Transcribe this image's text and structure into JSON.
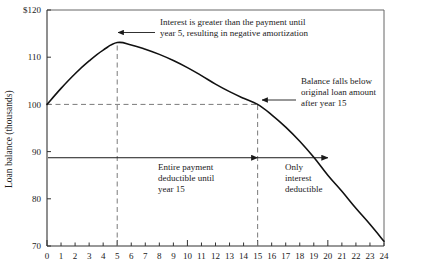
{
  "chart_data": {
    "type": "line",
    "title": "",
    "subtitle": "",
    "xlabel": "",
    "ylabel": "Loan balance (thousands)",
    "xlim": [
      0,
      24
    ],
    "ylim": [
      70,
      120
    ],
    "grid": false,
    "legend": "none",
    "x_ticks": [
      "0",
      "1",
      "2",
      "3",
      "4",
      "5",
      "6",
      "7",
      "8",
      "9",
      "10",
      "11",
      "12",
      "13",
      "14",
      "15",
      "16",
      "17",
      "18",
      "19",
      "20",
      "21",
      "22",
      "23",
      "24"
    ],
    "y_ticks": [
      "70",
      "80",
      "90",
      "100",
      "110",
      "$120"
    ],
    "y_tick_values": [
      70,
      80,
      90,
      100,
      110,
      120
    ],
    "series": [
      {
        "name": "Loan balance",
        "x": [
          0,
          1,
          2,
          3,
          4,
          5,
          6,
          7,
          8,
          9,
          10,
          11,
          12,
          13,
          14,
          15,
          16,
          17,
          18,
          19,
          20,
          21,
          22,
          23,
          24
        ],
        "values": [
          100.0,
          103.4,
          106.5,
          109.2,
          111.5,
          113.1,
          112.6,
          111.7,
          110.6,
          109.3,
          107.8,
          106.1,
          104.3,
          102.7,
          101.3,
          100.0,
          97.8,
          95.2,
          92.2,
          88.8,
          85.0,
          81.6,
          78.0,
          74.6,
          71.0
        ]
      }
    ],
    "reference_lines": [
      {
        "name": "original-loan-amount",
        "orientation": "horizontal",
        "value": 100,
        "style": "dashed",
        "from_x": 0,
        "to_x": 15
      },
      {
        "name": "year-5-marker",
        "orientation": "vertical",
        "value": 5,
        "style": "dashed",
        "from_y": 70,
        "to_y": 113.1
      },
      {
        "name": "year-15-marker",
        "orientation": "vertical",
        "value": 15,
        "style": "dashed",
        "from_y": 70,
        "to_y": 100
      },
      {
        "name": "deductibility-span",
        "orientation": "horizontal",
        "value": 88.7,
        "style": "solid-arrow",
        "from_x": 0,
        "to_x": 20
      }
    ],
    "annotations": [
      {
        "name": "negative-amortization-note",
        "line1": "Interest is greater than the payment until",
        "line2": "year 5, resulting in negative amortization",
        "points_to": {
          "x": 5,
          "y": 113.1
        }
      },
      {
        "name": "balance-below-original-note",
        "line1": "Balance falls below",
        "line2": "original loan amount",
        "line3": "after year 15",
        "points_to": {
          "x": 15,
          "y": 100
        }
      },
      {
        "name": "entire-payment-deductible-note",
        "line1": "Entire payment",
        "line2": "deductible until",
        "line3": "year 15",
        "span": [
          0,
          15
        ]
      },
      {
        "name": "only-interest-deductible-note",
        "line1": "Only",
        "line2": "interest",
        "line3": "deductible",
        "span": [
          15,
          20
        ]
      }
    ],
    "colors": {
      "curve": "#111111",
      "axis": "#555555",
      "dashed": "#777777",
      "text": "#1a1a1a",
      "background": "#ffffff"
    }
  }
}
